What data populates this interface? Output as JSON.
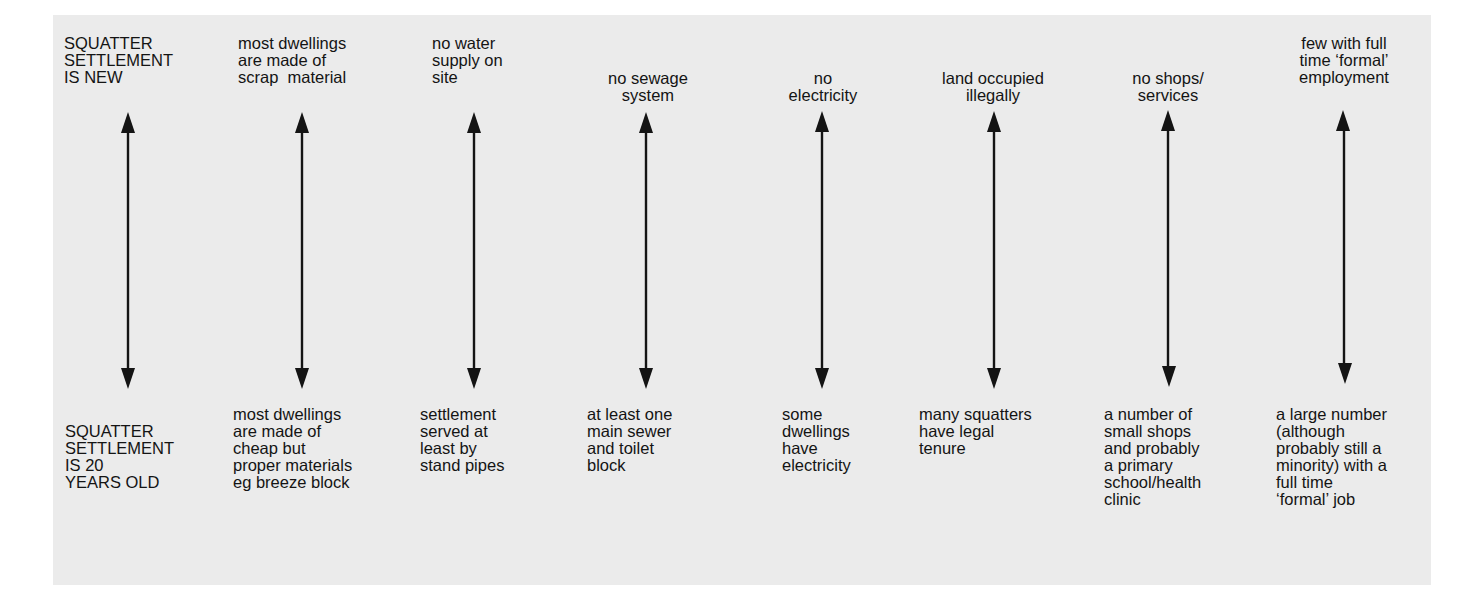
{
  "diagram": {
    "row_labels": {
      "top": "SQUATTER\nSETTLEMENT\nIS NEW",
      "bottom": "SQUATTER\nSETTLEMENT\nIS 20\nYEARS OLD"
    },
    "columns": [
      {
        "name": "dwellings",
        "top": "most dwellings\nare made of\nscrap  material",
        "bottom": "most dwellings\nare made of\ncheap but\nproper materials\neg breeze block"
      },
      {
        "name": "water",
        "top": "no water\nsupply on\nsite",
        "bottom": "settlement\nserved at\nleast by\nstand pipes"
      },
      {
        "name": "sewage",
        "top": "no sewage\nsystem",
        "bottom": "at least one\nmain sewer\nand toilet\nblock"
      },
      {
        "name": "electricity",
        "top": "no\nelectricity",
        "bottom": "some\ndwellings\nhave\nelectricity"
      },
      {
        "name": "land-tenure",
        "top": "land occupied\nillegally",
        "bottom": "many squatters\nhave legal\ntenure"
      },
      {
        "name": "shops-services",
        "top": "no shops/\nservices",
        "bottom": "a number of\nsmall shops\nand probably\na primary\nschool/health\nclinic"
      },
      {
        "name": "employment",
        "top": "few with full\ntime ‘formal’\nemployment",
        "bottom": "a large number\n(although\nprobably still a\nminority) with a\nfull time\n‘formal’ job"
      }
    ],
    "arrow_icon": "double-headed-vertical-arrow",
    "colors": {
      "panel": "#ebebeb",
      "ink": "#141414",
      "background": "#ffffff"
    }
  }
}
